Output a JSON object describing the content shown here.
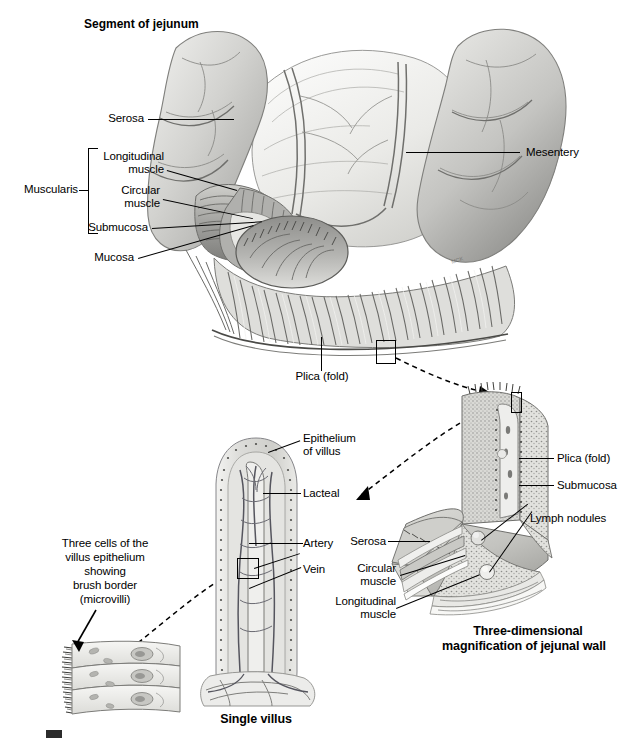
{
  "figure": {
    "title": "Segment of jejunum",
    "captions": {
      "single_villus": "Single villus",
      "three_dimensional": "Three-dimensional\nmagnification of jejunal wall"
    }
  },
  "top_panel": {
    "title": "Segment of jejunum",
    "labels": {
      "serosa": "Serosa",
      "muscularis": "Muscularis",
      "longitudinal_muscle": "Longitudinal\nmuscle",
      "circular_muscle": "Circular\nmuscle",
      "submucosa": "Submucosa",
      "mucosa": "Mucosa",
      "mesentery": "Mesentery",
      "plica_fold": "Plica (fold)"
    }
  },
  "villus_panel": {
    "caption": "Single villus",
    "labels": {
      "epithelium_of_villus": "Epithelium\nof villus",
      "lacteal": "Lacteal",
      "artery": "Artery",
      "vein": "Vein"
    }
  },
  "wall_panel": {
    "caption_line1": "Three-dimensional",
    "caption_line2": "magnification of jejunal wall",
    "labels": {
      "plica_fold": "Plica (fold)",
      "submucosa": "Submucosa",
      "lymph_nodules": "Lymph nodules",
      "serosa": "Serosa",
      "circular_muscle": "Circular\nmuscle",
      "longitudinal_muscle": "Longitudinal\nmuscle"
    }
  },
  "microvilli_panel": {
    "note": "Three cells of the\nvillus epithelium\nshowing\nbrush border\n(microvilli)"
  },
  "colors": {
    "ink": "#000000",
    "paper": "#ffffff",
    "tissue_light": "#e8e8e6",
    "tissue_mid": "#bdbdba",
    "tissue_dark": "#8d8d8a",
    "tissue_deep": "#5d5d5a"
  }
}
